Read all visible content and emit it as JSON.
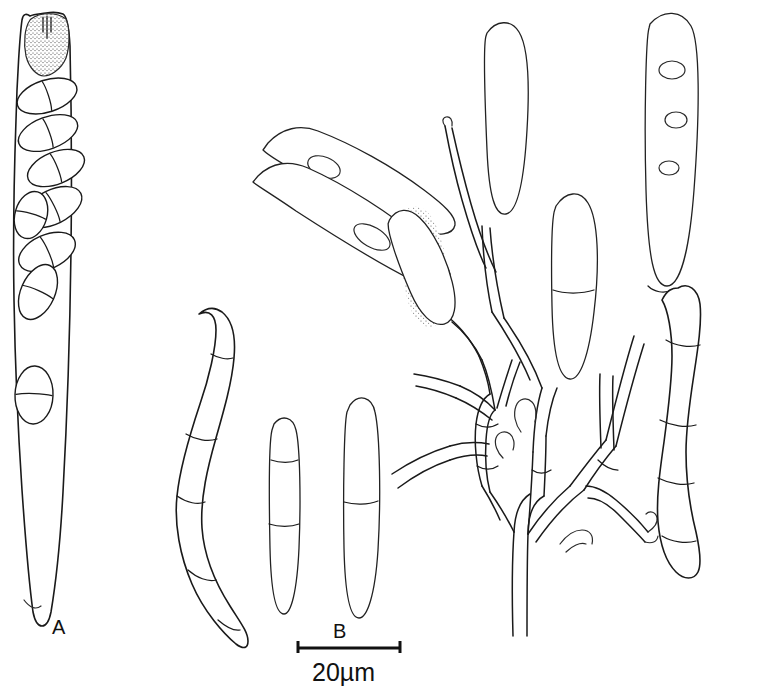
{
  "figure": {
    "kind": "scientific-line-drawing",
    "background_color": "#ffffff",
    "ink_color": "#1a1a1a",
    "width": 759,
    "height": 696
  },
  "labels": {
    "panel_a": "A",
    "panel_b": "B"
  },
  "scale_bar": {
    "text": "20µm",
    "length_px": 104,
    "x_start": 297,
    "x_end": 401,
    "y": 648
  },
  "panels": [
    {
      "id": "A",
      "label": "A",
      "label_x": 60,
      "label_y": 633,
      "description": "Cylindric-clavate ascus with stipitate base, stippled apical apparatus, and eight overlapping 1-septate ascospores",
      "ascospore_count": 8,
      "ascospore_septa": 1
    },
    {
      "id": "B",
      "label": "B",
      "label_x": 340,
      "label_y": 630,
      "description": "Branched conidiophores bearing cylindrical stippled conidia, plus detached multiseptate conidia"
    }
  ],
  "structures": {
    "ascus": {
      "name": "ascus",
      "apex": "stippled apical apparatus with pore",
      "base": "tapering stipe"
    },
    "conidia_free": [
      {
        "name": "curved-conidium-left",
        "septa": 5
      },
      {
        "name": "small-conidium-left",
        "septa": 2
      },
      {
        "name": "small-conidium-right",
        "septa": 1
      },
      {
        "name": "curved-conidium-right",
        "septa": 4
      }
    ],
    "conidiophore": {
      "name": "branched-conidiophore",
      "branching": "repeatedly branched, denticulate conidiogenous cells",
      "attached_conidia": 5
    }
  }
}
